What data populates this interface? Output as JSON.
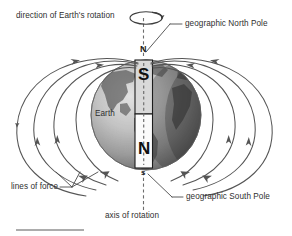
{
  "figure": {
    "title_alt": "Earth's magnetic field diagram",
    "background_color": "#ffffff",
    "line_color": "#4a4a4a",
    "text_color": "#2f2f2f"
  },
  "labels": {
    "direction_of_rotation": "direction of Earth's rotation",
    "geographic_north_pole": "geographic North Pole",
    "earth": "Earth",
    "lines_of_force": "lines of force",
    "geographic_south_pole": "geographic South Pole",
    "axis_of_rotation": "axis of rotation"
  },
  "pole_markers": {
    "north_cap": "N",
    "south_cap": "s"
  },
  "magnet_bar": {
    "top_pole": "S",
    "bottom_pole": "N",
    "top_half_fill": "#d8d8d8",
    "bottom_half_fill": "#fbfbfb",
    "border_color": "#1c1c1c",
    "description": "bar magnet inside Earth, magnetic south at geographic north"
  },
  "globe": {
    "center_x": 146,
    "center_y": 115,
    "radius": 55,
    "light_fill": "#c9c9c9",
    "dark_fill": "#6f6f6f"
  },
  "field_lines": {
    "count": 8,
    "arrow_direction": "toward geographic north pole",
    "color": "#555555"
  },
  "rotation_indicator": {
    "shape": "ellipse-with-arrow",
    "arrow_direction": "counterclockwise-from-above"
  },
  "footer_rule": {
    "visible": true,
    "color": "#5a5a5a"
  }
}
